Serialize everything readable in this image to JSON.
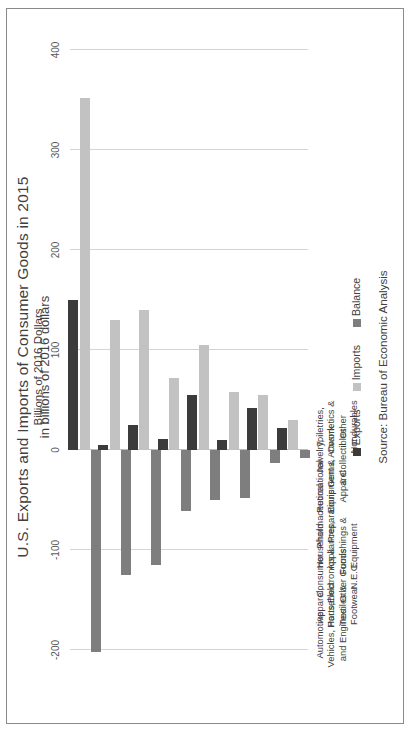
{
  "figure": {
    "title": "U.S. Exports and Imports of Consumer Goods in 2015",
    "subtitle": "in billions of 2016 dollars",
    "source_note": "Source: Bureau of Economic Analysis",
    "value_axis_title": "Billions of 2016 Dollars",
    "orientation": "rotated-90-ccw",
    "border_color": "#8a8a8a"
  },
  "legend": {
    "position": "bottom",
    "items": [
      {
        "label": "Exports",
        "color": "#3b3b3b"
      },
      {
        "label": "Imports",
        "color": "#c2c2c2"
      },
      {
        "label": "Balance",
        "color": "#7e7e7e"
      }
    ]
  },
  "chart_data": {
    "type": "bar",
    "title": "U.S. Exports and Imports of Consumer Goods in 2015",
    "subtitle": "in billions of 2016 dollars",
    "xlabel": "",
    "ylabel": "Billions of 2016 Dollars",
    "ylim": [
      -200,
      400
    ],
    "yticks": [
      400,
      300,
      200,
      100,
      0,
      -100,
      -200
    ],
    "ytick_labels": [
      "400",
      "300",
      "200",
      "100",
      "0",
      "-100",
      "-200"
    ],
    "grid": true,
    "legend_position": "bottom",
    "orientation": "horizontal-bars-rotated",
    "categories": [
      "Automotive Vehicles, Parts, and Engines",
      "Apparel, Household Textiles & Footwear",
      "Consumer Electronics & Other Goods N.E.C.",
      "Household Appliances, Furnishings & Equipment",
      "Pharmaceutical Preparations",
      "Recreational Equipment & Apparel",
      "Jewelry, Gems, Artwork & Collectibles",
      "Toiletries, Cosmetics & Other Nondurables"
    ],
    "category_lines": [
      [
        "Automotive",
        "Vehicles, Parts,",
        "and Engines"
      ],
      [
        "Apparel,",
        "Household",
        "Textiles &",
        "Footwear"
      ],
      [
        "Consumer",
        "Electronics &",
        "Other Goods",
        "N.E.C."
      ],
      [
        "Household",
        "Appliances,",
        "Furnishings &",
        "Equipment"
      ],
      [
        "Pharmaceutical",
        "Preparations"
      ],
      [
        "Recreational",
        "Equipment &",
        "Apparel"
      ],
      [
        "Jewelry,",
        "Gems, Artwork",
        "& Collectibles"
      ],
      [
        "Toiletries,",
        "Cosmetics &",
        "Other",
        "Nondurables"
      ]
    ],
    "series": [
      {
        "name": "Exports",
        "color": "#3b3b3b",
        "values": [
          150,
          5,
          25,
          11,
          55,
          10,
          42,
          22
        ]
      },
      {
        "name": "Imports",
        "color": "#c2c2c2",
        "values": [
          352,
          130,
          140,
          72,
          105,
          58,
          55,
          30
        ]
      },
      {
        "name": "Balance",
        "color": "#7e7e7e",
        "values": [
          -202,
          -125,
          -115,
          -61,
          -50,
          -48,
          -13,
          -8
        ]
      }
    ]
  }
}
